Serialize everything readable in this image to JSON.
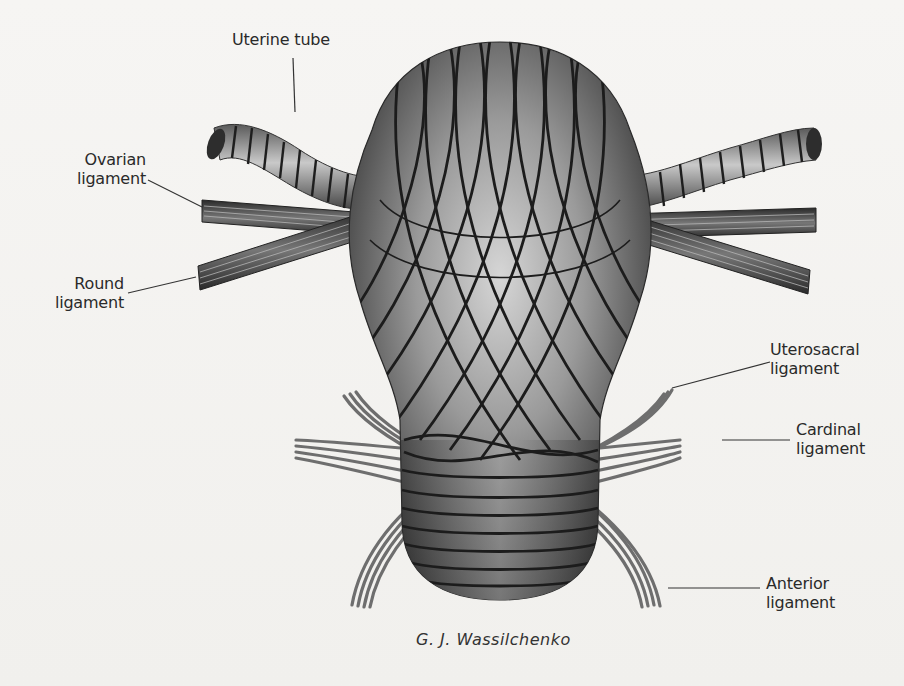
{
  "figure": {
    "labels": {
      "uterine_tube": "Uterine tube",
      "ovarian_ligament": [
        "Ovarian",
        "ligament"
      ],
      "round_ligament": [
        "Round",
        "ligament"
      ],
      "uterosacral_ligament": [
        "Uterosacral",
        "ligament"
      ],
      "cardinal_ligament": [
        "Cardinal",
        "ligament"
      ],
      "anterior_ligament": [
        "Anterior",
        "ligament"
      ]
    },
    "signature": "G. J. Wassilchenko"
  },
  "colors": {
    "background": "#f4f3f1",
    "body_dark": "#3a3a3a",
    "body_light": "#c8c8c8",
    "fiber": "#1c1c1c",
    "ligament_gray": "#6e6e6e",
    "label_text": "#2a2a2a",
    "leader_line": "#333333"
  }
}
